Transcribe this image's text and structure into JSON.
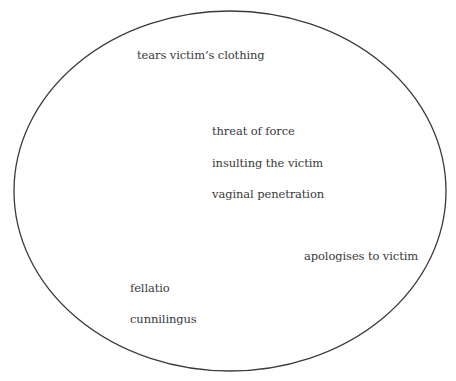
{
  "diagram": {
    "shape": "ellipse",
    "ellipse": {
      "cx": 230,
      "cy": 191,
      "rx": 216,
      "ry": 180,
      "stroke": "#3a3a3a",
      "stroke_width": 1.3
    },
    "labels": [
      {
        "id": "tears-clothing",
        "text": "tears victim’s clothing",
        "x": 137,
        "y": 48
      },
      {
        "id": "threat-of-force",
        "text": "threat of force",
        "x": 212,
        "y": 124
      },
      {
        "id": "insulting-victim",
        "text": "insulting the victim",
        "x": 212,
        "y": 156
      },
      {
        "id": "vaginal-penetration",
        "text": "vaginal penetration",
        "x": 212,
        "y": 187
      },
      {
        "id": "apologises",
        "text": "apologises to victim",
        "x": 304,
        "y": 249
      },
      {
        "id": "fellatio",
        "text": "fellatio",
        "x": 130,
        "y": 281
      },
      {
        "id": "cunnilingus",
        "text": "cunnilingus",
        "x": 130,
        "y": 312
      }
    ]
  }
}
